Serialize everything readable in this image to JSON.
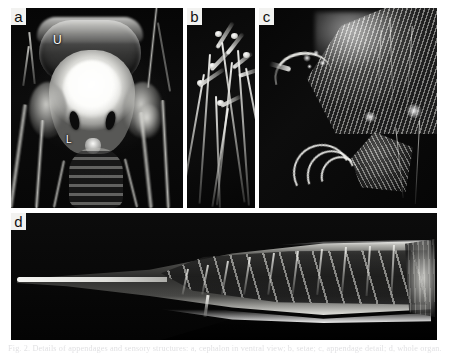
{
  "figure": {
    "label": "Scanning electron / light micrograph composite figure",
    "background_color": "#ffffff",
    "panel_background_color": "#0a0a0a",
    "label_box_color": "#f2f2f0",
    "label_text_color": "#111111",
    "annotation_color": "#ffffff"
  },
  "panels": [
    {
      "id": "a",
      "label": "a",
      "description": "Ventral view of cephalon showing hood-like carapace, bright cephalic mass, paired dark eye slits, and surrounding appendages",
      "annotations": [
        {
          "text": "U",
          "name": "annotation-u"
        },
        {
          "text": "L",
          "name": "annotation-l"
        }
      ]
    },
    {
      "id": "b",
      "label": "b",
      "description": "Cluster of elongate filamentous setae with terminal bulbs against a dark background",
      "annotations": []
    },
    {
      "id": "c",
      "label": "c",
      "description": "Detail of appendage showing striated plate, curved terminal spine and claw-like hooks",
      "annotations": []
    },
    {
      "id": "d",
      "label": "d",
      "description": "Full length lateral view of an elongate tapering organ with segmented internal striations and a fine needle-like distal process",
      "annotations": []
    }
  ],
  "caption": {
    "text": "Fig. 2. Details of appendages and sensory structures: a, cephalon in ventral view; b, setae; c, appendage detail; d, whole organ.",
    "visible_state": "clipped at page bottom edge"
  }
}
